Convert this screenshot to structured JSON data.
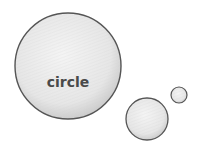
{
  "diagram": {
    "style": "pencil-sketch",
    "stroke_color": "#555555",
    "fill_color": "#ececec",
    "shade_color": "#c8c8c8",
    "circles": [
      {
        "name": "large",
        "cx": 68,
        "cy": 66,
        "r": 53,
        "label": "circle"
      },
      {
        "name": "medium",
        "cx": 147,
        "cy": 119,
        "r": 21,
        "label": ""
      },
      {
        "name": "small",
        "cx": 179,
        "cy": 95,
        "r": 8,
        "label": ""
      }
    ]
  }
}
